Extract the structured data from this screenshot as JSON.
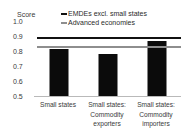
{
  "chart_data": {
    "type": "bar",
    "title": "",
    "subtitle": "",
    "xlabel": "",
    "ylabel": "Score",
    "ylim": [
      0.5,
      1.0
    ],
    "ytick_labels": [
      "1.0",
      "0.9",
      "0.8",
      "0.7",
      "0.6",
      "0.5"
    ],
    "ytick_values": [
      1.0,
      0.9,
      0.8,
      0.7,
      0.6,
      0.5
    ],
    "grid": false,
    "legend_position": "top-right",
    "categories": [
      "Small states",
      "Small states: Commodity exporters",
      "Small states: Commodity importers"
    ],
    "category_lines": [
      [
        "Small states"
      ],
      [
        "Small states:",
        "Commodity",
        "exporters"
      ],
      [
        "Small states:",
        "Commodity",
        "importers"
      ]
    ],
    "series": [
      {
        "name": "Small states",
        "type": "bar",
        "color": "#0b0b0b",
        "values": [
          0.82,
          0.785,
          0.875
        ]
      }
    ],
    "reference_lines": [
      {
        "name": "EMDEs excl. small states",
        "value": 0.885,
        "color": "#111111",
        "style": "solid"
      },
      {
        "name": "Advanced economies",
        "value": 0.83,
        "color": "#8e8e8e",
        "style": "solid"
      }
    ],
    "legend": [
      {
        "label": "EMDEs excl. small states",
        "color": "#111111"
      },
      {
        "label": "Advanced economies",
        "color": "#8e8e8e"
      }
    ]
  }
}
